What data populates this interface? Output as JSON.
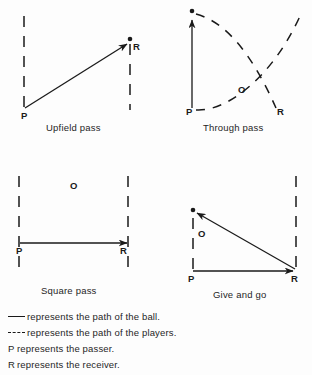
{
  "page": {
    "background_color": "#fdfdfd",
    "ink_color": "#1a1a1a"
  },
  "diagrams": [
    {
      "id": "upfield-pass",
      "caption": "Upfield pass",
      "passer_label": "P",
      "receiver_label": "R",
      "offense_label": null,
      "description": "Solid ball-path arrow runs diagonally from P at lower left up to R at upper right; vertical dashed touchlines at left and right."
    },
    {
      "id": "through-pass",
      "caption": "Through pass",
      "passer_label": "P",
      "receiver_label": "R",
      "offense_label": "O",
      "description": "Solid ball-path arrow runs straight up from P; two dashed player-path curves cross, one from the top dot down to the lower right, one from P up to the upper right."
    },
    {
      "id": "square-pass",
      "caption": "Square pass",
      "passer_label": "P",
      "receiver_label": "R",
      "offense_label": "O",
      "description": "Solid horizontal ball-path arrow runs from P at left to R at right; opponent O sits above midline; vertical dashed touchlines at left and right."
    },
    {
      "id": "give-and-go",
      "caption": "Give and go",
      "passer_label": "P",
      "receiver_label": "R",
      "offense_label": "O",
      "description": "Solid horizontal ball-path arrow runs from P to R at lower right, then a second solid arrow returns diagonally up-left to a dot; dashed lines at left and right."
    }
  ],
  "legend": {
    "rows": [
      {
        "marker": "solid-line",
        "key": "",
        "text": "represents the path of the ball."
      },
      {
        "marker": "dashed-line",
        "key": "",
        "text": "represents the path of the players."
      },
      {
        "marker": "none",
        "key": "P",
        "text": "represents the passer."
      },
      {
        "marker": "none",
        "key": "R",
        "text": "represents the receiver."
      }
    ]
  }
}
